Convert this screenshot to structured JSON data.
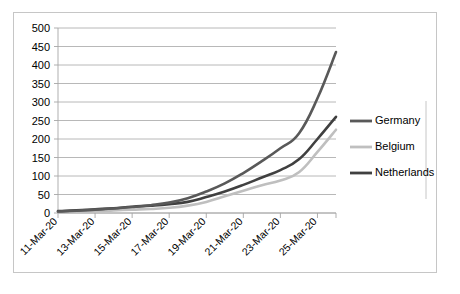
{
  "chart_data": {
    "type": "line",
    "title": "",
    "xlabel": "",
    "ylabel": "",
    "ylim": [
      0,
      500
    ],
    "y_ticks": [
      0,
      50,
      100,
      150,
      200,
      250,
      300,
      350,
      400,
      450,
      500
    ],
    "grid": true,
    "legend_position": "right",
    "x": [
      "11-Mar-20",
      "12-Mar-20",
      "13-Mar-20",
      "14-Mar-20",
      "15-Mar-20",
      "16-Mar-20",
      "17-Mar-20",
      "18-Mar-20",
      "19-Mar-20",
      "20-Mar-20",
      "21-Mar-20",
      "22-Mar-20",
      "23-Mar-20",
      "24-Mar-20",
      "25-Mar-20",
      "26-Mar-20"
    ],
    "x_tick_labels": [
      "11-Mar-20",
      "13-Mar-20",
      "15-Mar-20",
      "17-Mar-20",
      "19-Mar-20",
      "21-Mar-20",
      "23-Mar-20",
      "25-Mar-20"
    ],
    "series": [
      {
        "name": "Germany",
        "color": "#595959",
        "values": [
          4,
          6,
          9,
          12,
          16,
          21,
          28,
          40,
          58,
          80,
          108,
          140,
          175,
          215,
          310,
          435
        ]
      },
      {
        "name": "Belgium",
        "color": "#bfbfbf",
        "values": [
          3,
          4,
          5,
          7,
          9,
          11,
          14,
          20,
          30,
          45,
          60,
          75,
          88,
          110,
          165,
          225
        ]
      },
      {
        "name": "Netherlands",
        "color": "#404040",
        "values": [
          5,
          7,
          10,
          13,
          17,
          20,
          24,
          30,
          43,
          58,
          76,
          96,
          116,
          145,
          200,
          260
        ]
      }
    ]
  },
  "legend": {
    "entries": [
      {
        "label": "Germany"
      },
      {
        "label": "Belgium"
      },
      {
        "label": "Netherlands"
      }
    ]
  }
}
